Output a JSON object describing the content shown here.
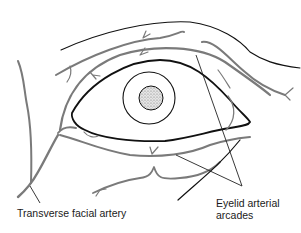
{
  "figure": {
    "colors": {
      "background": "#ffffff",
      "outline": "#111111",
      "vessel": "#7a7a7a",
      "iris_fill": "#ffffff",
      "pupil_fill": "#d9d9d9",
      "label_text": "#1a1a1a"
    }
  },
  "labels": {
    "transverse_facial_artery": "Transverse facial artery",
    "eyelid_arterial_arcades_line1": "Eyelid arterial",
    "eyelid_arterial_arcades_line2": "arcades"
  }
}
